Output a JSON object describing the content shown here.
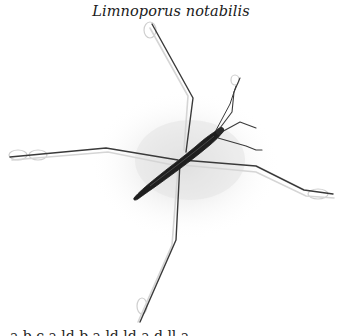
{
  "figure": {
    "title": "Limnoporus notabilis",
    "caption_partial": "a b c a ld b a ld ld a d ll a",
    "colors": {
      "background": "#ffffff",
      "body": "#2b2b2b",
      "legs": "#3a3a3a",
      "shadow": "#e6e6e6",
      "ripple": "#cfcfcf"
    }
  }
}
